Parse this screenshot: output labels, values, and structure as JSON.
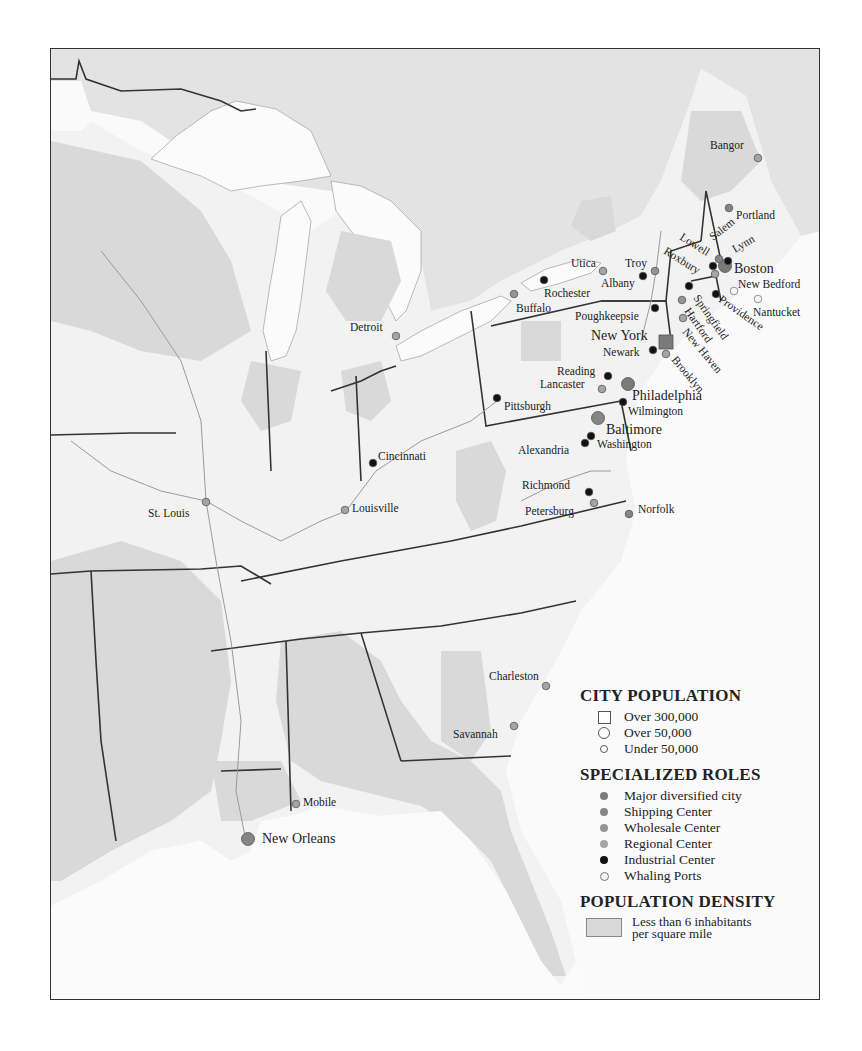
{
  "map": {
    "credit": "(After Conzen)",
    "colors": {
      "land": "#f2f2f2",
      "water": "#fbfbfb",
      "foreign_land": "#e3e3e3",
      "sparse_density": "#d9d9d9",
      "state_border": "#333333",
      "river": "#9a9a9a",
      "major_diversified": "#7a7a7a",
      "shipping": "#858585",
      "wholesale": "#959595",
      "regional": "#a5a5a5",
      "industrial": "#111111",
      "whaling": "#f5f5f5"
    }
  },
  "legend": {
    "population": {
      "title": "CITY POPULATION",
      "items": [
        {
          "symbol": "square",
          "label": "Over 300,000"
        },
        {
          "symbol": "circle-large",
          "label": "Over 50,000"
        },
        {
          "symbol": "circle-small",
          "label": "Under 50,000"
        }
      ]
    },
    "roles": {
      "title": "SPECIALIZED ROLES",
      "items": [
        {
          "role": "major_diversified",
          "label": "Major diversified city"
        },
        {
          "role": "shipping",
          "label": "Shipping Center"
        },
        {
          "role": "wholesale",
          "label": "Wholesale Center"
        },
        {
          "role": "regional",
          "label": "Regional Center"
        },
        {
          "role": "industrial",
          "label": "Industrial Center"
        },
        {
          "role": "whaling",
          "label": "Whaling Ports"
        }
      ]
    },
    "density": {
      "title": "POPULATION DENSITY",
      "label": "Less than 6 inhabitants per square mile"
    }
  },
  "cities": [
    {
      "name": "Bangor",
      "x": 757,
      "y": 157,
      "size": "small",
      "role": "regional",
      "lx": 709,
      "ly": 148,
      "rot": 0
    },
    {
      "name": "Portland",
      "x": 728,
      "y": 207,
      "size": "small",
      "role": "shipping",
      "lx": 735,
      "ly": 218,
      "rot": 0
    },
    {
      "name": "Boston",
      "x": 724,
      "y": 265,
      "size": "large",
      "role": "major_diversified",
      "lx": 733,
      "ly": 272,
      "rot": 0
    },
    {
      "name": "Salem",
      "x": 718,
      "y": 258,
      "size": "small",
      "role": "shipping",
      "lx": 712,
      "ly": 240,
      "rot": -38
    },
    {
      "name": "Lynn",
      "x": 727,
      "y": 260,
      "size": "small",
      "role": "industrial",
      "lx": 734,
      "ly": 252,
      "rot": -30
    },
    {
      "name": "Lowell",
      "x": 712,
      "y": 265,
      "size": "small",
      "role": "industrial",
      "lx": 678,
      "ly": 238,
      "rot": 32
    },
    {
      "name": "Roxbury",
      "x": 714,
      "y": 273,
      "size": "small",
      "role": "regional",
      "lx": 662,
      "ly": 252,
      "rot": 32
    },
    {
      "name": "New Bedford",
      "x": 733,
      "y": 290,
      "size": "small",
      "role": "whaling",
      "lx": 737,
      "ly": 287,
      "rot": 0
    },
    {
      "name": "Nantucket",
      "x": 757,
      "y": 298,
      "size": "small",
      "role": "whaling",
      "lx": 752,
      "ly": 315,
      "rot": 0
    },
    {
      "name": "Providence",
      "x": 715,
      "y": 293,
      "size": "small",
      "role": "industrial",
      "lx": 717,
      "ly": 300,
      "rot": 35
    },
    {
      "name": "Springfield",
      "x": 688,
      "y": 285,
      "size": "small",
      "role": "industrial",
      "lx": 692,
      "ly": 297,
      "rot": 55
    },
    {
      "name": "Hartford",
      "x": 681,
      "y": 299,
      "size": "small",
      "role": "wholesale",
      "lx": 683,
      "ly": 310,
      "rot": 55
    },
    {
      "name": "New Haven",
      "x": 682,
      "y": 317,
      "size": "small",
      "role": "regional",
      "lx": 681,
      "ly": 331,
      "rot": 50
    },
    {
      "name": "Troy",
      "x": 654,
      "y": 270,
      "size": "small",
      "role": "wholesale",
      "lx": 624,
      "ly": 266,
      "rot": 0
    },
    {
      "name": "Albany",
      "x": 642,
      "y": 275,
      "size": "small",
      "role": "industrial",
      "lx": 600,
      "ly": 286,
      "rot": 0
    },
    {
      "name": "Utica",
      "x": 602,
      "y": 270,
      "size": "small",
      "role": "regional",
      "lx": 570,
      "ly": 266,
      "rot": 0
    },
    {
      "name": "Rochester",
      "x": 543,
      "y": 279,
      "size": "small",
      "role": "industrial",
      "lx": 543,
      "ly": 296,
      "rot": 0
    },
    {
      "name": "Buffalo",
      "x": 513,
      "y": 293,
      "size": "small",
      "role": "wholesale",
      "lx": 515,
      "ly": 311,
      "rot": 0
    },
    {
      "name": "Poughkeepsie",
      "x": 654,
      "y": 307,
      "size": "small",
      "role": "industrial",
      "lx": 574,
      "ly": 319,
      "rot": 0
    },
    {
      "name": "New York",
      "x": 665,
      "y": 341,
      "size": "square",
      "role": "major_diversified",
      "lx": 590,
      "ly": 339,
      "rot": 0
    },
    {
      "name": "Newark",
      "x": 652,
      "y": 349,
      "size": "small",
      "role": "industrial",
      "lx": 602,
      "ly": 355,
      "rot": 0
    },
    {
      "name": "Brooklyn",
      "x": 665,
      "y": 353,
      "size": "small",
      "role": "regional",
      "lx": 670,
      "ly": 359,
      "rot": 50
    },
    {
      "name": "Reading",
      "x": 607,
      "y": 375,
      "size": "small",
      "role": "industrial",
      "lx": 556,
      "ly": 374,
      "rot": 0
    },
    {
      "name": "Lancaster",
      "x": 601,
      "y": 388,
      "size": "small",
      "role": "regional",
      "lx": 539,
      "ly": 387,
      "rot": 0
    },
    {
      "name": "Philadelphia",
      "x": 627,
      "y": 383,
      "size": "large",
      "role": "major_diversified",
      "lx": 631,
      "ly": 399,
      "rot": 0
    },
    {
      "name": "Wilmington",
      "x": 622,
      "y": 401,
      "size": "small",
      "role": "industrial",
      "lx": 627,
      "ly": 414,
      "rot": 0
    },
    {
      "name": "Baltimore",
      "x": 597,
      "y": 417,
      "size": "large",
      "role": "shipping",
      "lx": 605,
      "ly": 433,
      "rot": 0
    },
    {
      "name": "Washington",
      "x": 590,
      "y": 435,
      "size": "small",
      "role": "industrial",
      "lx": 596,
      "ly": 447,
      "rot": 0
    },
    {
      "name": "Alexandria",
      "x": 584,
      "y": 442,
      "size": "small",
      "role": "industrial",
      "lx": 517,
      "ly": 453,
      "rot": 0
    },
    {
      "name": "Pittsburgh",
      "x": 496,
      "y": 397,
      "size": "small",
      "role": "industrial",
      "lx": 503,
      "ly": 409,
      "rot": 0
    },
    {
      "name": "Richmond",
      "x": 588,
      "y": 491,
      "size": "small",
      "role": "industrial",
      "lx": 521,
      "ly": 488,
      "rot": 0
    },
    {
      "name": "Petersburg",
      "x": 593,
      "y": 502,
      "size": "small",
      "role": "regional",
      "lx": 524,
      "ly": 514,
      "rot": 0
    },
    {
      "name": "Norfolk",
      "x": 628,
      "y": 513,
      "size": "small",
      "role": "shipping",
      "lx": 637,
      "ly": 512,
      "rot": 0
    },
    {
      "name": "Detroit",
      "x": 395,
      "y": 335,
      "size": "small",
      "role": "regional",
      "lx": 349,
      "ly": 330,
      "rot": 0
    },
    {
      "name": "Cincinnati",
      "x": 372,
      "y": 462,
      "size": "small",
      "role": "industrial",
      "lx": 377,
      "ly": 459,
      "rot": 0
    },
    {
      "name": "Louisville",
      "x": 344,
      "y": 509,
      "size": "small",
      "role": "regional",
      "lx": 351,
      "ly": 511,
      "rot": 0
    },
    {
      "name": "St. Louis",
      "x": 205,
      "y": 501,
      "size": "small",
      "role": "regional",
      "lx": 147,
      "ly": 516,
      "rot": 0
    },
    {
      "name": "Charleston",
      "x": 545,
      "y": 685,
      "size": "small",
      "role": "regional",
      "lx": 488,
      "ly": 679,
      "rot": 0
    },
    {
      "name": "Savannah",
      "x": 513,
      "y": 725,
      "size": "small",
      "role": "regional",
      "lx": 452,
      "ly": 737,
      "rot": 0
    },
    {
      "name": "Mobile",
      "x": 295,
      "y": 803,
      "size": "small",
      "role": "regional",
      "lx": 302,
      "ly": 805,
      "rot": 0
    },
    {
      "name": "New Orleans",
      "x": 247,
      "y": 838,
      "size": "large",
      "role": "shipping",
      "lx": 261,
      "ly": 842,
      "rot": 0
    }
  ]
}
